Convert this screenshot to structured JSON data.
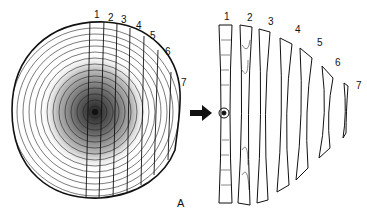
{
  "figure": {
    "panel_label": "A",
    "log_labels": [
      "1",
      "2",
      "3",
      "4",
      "5",
      "6",
      "7"
    ],
    "slab_labels": [
      "1",
      "2",
      "3",
      "4",
      "5",
      "6",
      "7"
    ],
    "arrow": "arrow-right"
  }
}
